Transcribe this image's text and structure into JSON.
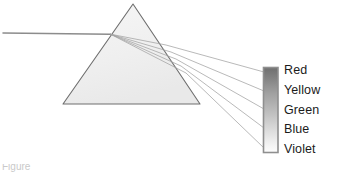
{
  "figure": {
    "background_color": "#ffffff",
    "width": 338,
    "height": 172
  },
  "prism": {
    "name": "triangular-prism",
    "apex": {
      "x": 133,
      "y": 4
    },
    "base_left": {
      "x": 63,
      "y": 104
    },
    "base_right": {
      "x": 200,
      "y": 104
    },
    "fill_color": "#f1f1f1",
    "stroke_color": "#6e6e6e"
  },
  "incident_ray": {
    "label": "white-light-beam",
    "start": {
      "x": 3,
      "y": 33
    },
    "end": {
      "x": 110,
      "y": 34
    },
    "color": "#8a8a8a"
  },
  "refracted_rays": {
    "entry_point": {
      "x": 110,
      "y": 34
    },
    "color": "#9a9a9a",
    "count": 5,
    "rays": [
      {
        "name": "ray-red",
        "exit": {
          "x": 166,
          "y": 45
        },
        "target": {
          "x": 264,
          "y": 72
        }
      },
      {
        "name": "ray-yellow",
        "exit": {
          "x": 171,
          "y": 52
        },
        "target": {
          "x": 264,
          "y": 91
        }
      },
      {
        "name": "ray-green",
        "exit": {
          "x": 176,
          "y": 59
        },
        "target": {
          "x": 264,
          "y": 109
        }
      },
      {
        "name": "ray-blue",
        "exit": {
          "x": 181,
          "y": 66
        },
        "target": {
          "x": 264,
          "y": 128
        }
      },
      {
        "name": "ray-violet",
        "exit": {
          "x": 186,
          "y": 73
        },
        "target": {
          "x": 264,
          "y": 148
        }
      }
    ]
  },
  "spectrum_bar": {
    "name": "spectrum-bar",
    "x": 263,
    "y": 67,
    "width": 15,
    "height": 85,
    "border_color": "#8f8f8f",
    "gradient_top_color": "#7d7d7d",
    "gradient_bottom_color": "#fdfdfd"
  },
  "spectrum_labels": [
    {
      "text": "Red"
    },
    {
      "text": "Yellow"
    },
    {
      "text": "Green"
    },
    {
      "text": "Blue"
    },
    {
      "text": "Violet"
    }
  ],
  "caption": {
    "text": "Figure"
  }
}
